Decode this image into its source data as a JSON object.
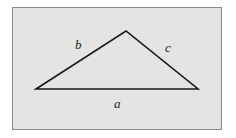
{
  "diagram": {
    "type": "triangle",
    "background": "#e4e4e4",
    "stroke": "#1a1a1a",
    "vertices": {
      "left": [
        36,
        89
      ],
      "apex": [
        126,
        31
      ],
      "right": [
        198,
        89
      ]
    },
    "labels": {
      "b": "b",
      "c": "c",
      "a": "a"
    }
  }
}
